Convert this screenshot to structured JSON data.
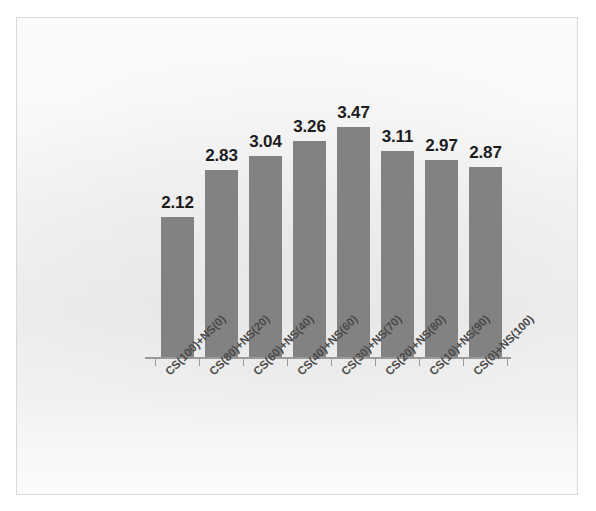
{
  "chart_data": {
    "type": "bar",
    "title": "",
    "subtitle": "",
    "xlabel": "",
    "ylabel": "",
    "ylim": [
      0,
      3.85
    ],
    "grid": false,
    "legend": false,
    "legend_position": "none",
    "bar_color": "#828282",
    "label_color": "#1c1c1c",
    "axis_color": "#9a9a9a",
    "categories": [
      "CS(100)+NS(0)",
      "CS(80)+NS(20)",
      "CS(60)+NS(40)",
      "CS(40)+NS(60)",
      "CS(30)+NS(70)",
      "CS(20)+NS(80)",
      "CS(10)+NS(90)",
      "CS(0)+NS(100)"
    ],
    "values": [
      2.12,
      2.83,
      3.04,
      3.26,
      3.47,
      3.11,
      2.97,
      2.87
    ],
    "value_labels": [
      "2.12",
      "2.83",
      "3.04",
      "3.26",
      "3.47",
      "3.11",
      "2.97",
      "2.87"
    ]
  }
}
